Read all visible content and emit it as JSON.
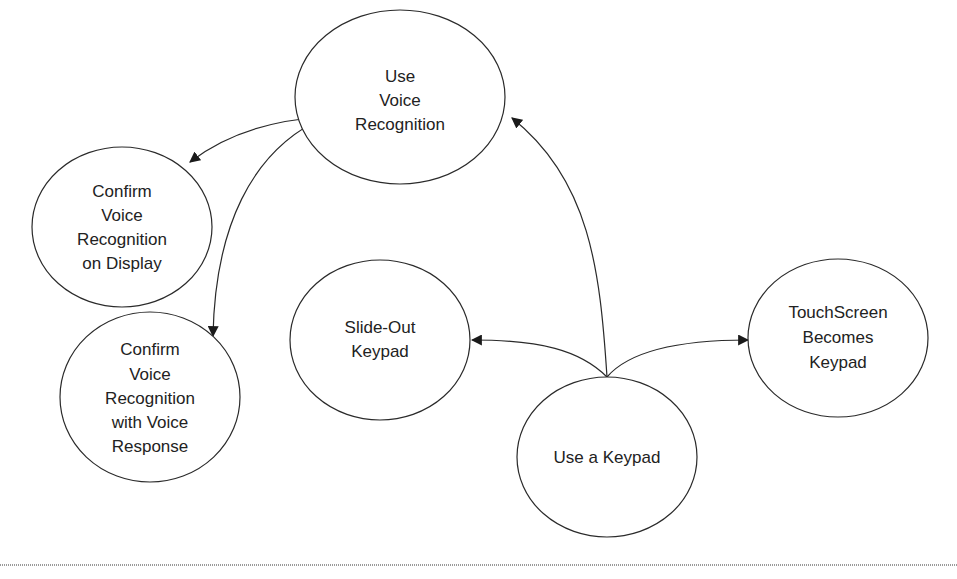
{
  "diagram": {
    "type": "flow-diagram",
    "nodes": [
      {
        "id": "voice",
        "lines": [
          "Use",
          "Voice",
          "Recognition"
        ]
      },
      {
        "id": "display",
        "lines": [
          "Confirm",
          "Voice",
          "Recognition",
          "on Display"
        ]
      },
      {
        "id": "voice_response",
        "lines": [
          "Confirm",
          "Voice",
          "Recognition",
          "with Voice",
          "Response"
        ]
      },
      {
        "id": "slideout",
        "lines": [
          "Slide-Out",
          "Keypad"
        ]
      },
      {
        "id": "keypad",
        "lines": [
          "Use a Keypad"
        ]
      },
      {
        "id": "touchscreen",
        "lines": [
          "TouchScreen",
          "Becomes",
          "Keypad"
        ]
      }
    ],
    "edges": [
      {
        "from": "voice",
        "to": "display"
      },
      {
        "from": "voice",
        "to": "voice_response"
      },
      {
        "from": "keypad",
        "to": "voice"
      },
      {
        "from": "keypad",
        "to": "slideout"
      },
      {
        "from": "keypad",
        "to": "touchscreen"
      }
    ],
    "colors": {
      "stroke": "#2a2a2a",
      "text": "#222222",
      "background": "#ffffff",
      "divider": "#9a9a9a"
    }
  }
}
